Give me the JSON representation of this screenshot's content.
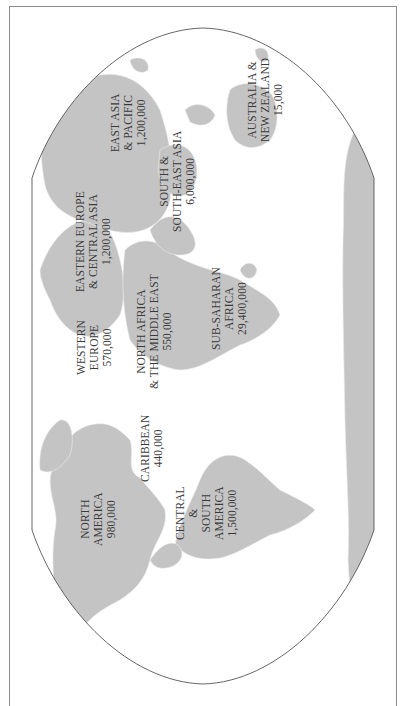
{
  "map": {
    "orientation": "rotated 90° counter-clockwise (north points left)",
    "colors": {
      "land": "#c4c4c4",
      "border_lines": "#e9e9e9",
      "outline": "#555555",
      "frame": "#8a8a8a",
      "label": "#3a3a3a",
      "background": "#ffffff"
    },
    "regions": [
      {
        "id": "north-america",
        "lines": [
          "NORTH",
          "AMERICA",
          "980,000"
        ],
        "name": "North America",
        "value": "980,000"
      },
      {
        "id": "caribbean",
        "lines": [
          "CARIBBEAN",
          "440,000"
        ],
        "name": "Caribbean",
        "value": "440,000"
      },
      {
        "id": "central-south-america",
        "lines": [
          "CENTRAL",
          "&",
          "SOUTH",
          "AMERICA",
          "1,500,000"
        ],
        "name": "Central & South America",
        "value": "1,500,000"
      },
      {
        "id": "western-europe",
        "lines": [
          "WESTERN",
          "EUROPE",
          "570,000"
        ],
        "name": "Western Europe",
        "value": "570,000"
      },
      {
        "id": "north-africa-middle-east",
        "lines": [
          "NORTH AFRICA",
          "& THE MIDDLE EAST",
          "550,000"
        ],
        "name": "North Africa & the Middle East",
        "value": "550,000"
      },
      {
        "id": "sub-saharan-africa",
        "lines": [
          "SUB-SAHARAN",
          "AFRICA",
          "29,400,000"
        ],
        "name": "Sub-Saharan Africa",
        "value": "29,400,000"
      },
      {
        "id": "eastern-europe-central-asia",
        "lines": [
          "EASTERN EUROPE",
          "& CENTRAL ASIA",
          "1,200,000"
        ],
        "name": "Eastern Europe & Central Asia",
        "value": "1,200,000"
      },
      {
        "id": "south-southeast-asia",
        "lines": [
          "SOUTH &",
          "SOUTH-EAST ASIA",
          "6,000,000"
        ],
        "name": "South & South-East Asia",
        "value": "6,000,000"
      },
      {
        "id": "east-asia-pacific",
        "lines": [
          "EAST ASIA",
          "& PACIFIC",
          "1,200,000"
        ],
        "name": "East Asia & Pacific",
        "value": "1,200,000"
      },
      {
        "id": "australia-new-zealand",
        "lines": [
          "AUSTRALIA &",
          "NEW ZEALAND",
          "15,000"
        ],
        "name": "Australia & New Zealand",
        "value": "15,000"
      }
    ]
  }
}
